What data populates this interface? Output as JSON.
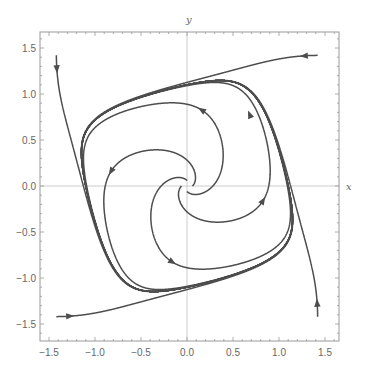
{
  "chart_data": {
    "type": "line",
    "subtype": "phase-portrait-stream",
    "title": "",
    "xlabel": "x",
    "ylabel": "y",
    "xlim": [
      -1.6,
      1.65
    ],
    "ylim": [
      -1.68,
      1.67
    ],
    "grid": false,
    "axes_through_origin": true,
    "legend": null,
    "x_ticks": [
      -1.5,
      -1.0,
      -0.5,
      0.0,
      0.5,
      1.0,
      1.5
    ],
    "x_tick_labels": [
      "−1.5",
      "−1.0",
      "−0.5",
      "0.0",
      "0.5",
      "1.0",
      "1.5"
    ],
    "y_ticks": [
      1.5,
      1.0,
      0.5,
      0.0,
      -0.5,
      -1.0,
      -1.5
    ],
    "y_tick_labels": [
      "1.5",
      "1.0",
      "0.5",
      "0.0",
      "−0.5",
      "−1.0",
      "−1.5"
    ],
    "system": {
      "dx": "x - y - x^3",
      "dy": "x + y - y^3",
      "description": "Trajectories spiral out from the unstable origin and in from the corners toward a stable limit cycle near the unit circle (counter-clockwise)."
    },
    "series": [
      {
        "name": "outer-top-right",
        "start": [
          1.42,
          1.42
        ],
        "t_end": 14,
        "arrow_at_t": 0.05
      },
      {
        "name": "outer-top-left",
        "start": [
          -1.42,
          1.42
        ],
        "t_end": 14,
        "arrow_at_t": 0.05
      },
      {
        "name": "outer-bottom-left",
        "start": [
          -1.42,
          -1.42
        ],
        "t_end": 14,
        "arrow_at_t": 0.05
      },
      {
        "name": "outer-bottom-right",
        "start": [
          1.42,
          -1.42
        ],
        "t_end": 14,
        "arrow_at_t": 0.05
      },
      {
        "name": "inner-right",
        "start": [
          0.06,
          0.0
        ],
        "t_end": 14,
        "arrow_at_t": 3.0
      },
      {
        "name": "inner-top",
        "start": [
          0.0,
          0.06
        ],
        "t_end": 14,
        "arrow_at_t": 3.0
      },
      {
        "name": "inner-left",
        "start": [
          -0.06,
          0.0
        ],
        "t_end": 14,
        "arrow_at_t": 3.0
      },
      {
        "name": "inner-bottom",
        "start": [
          0.0,
          -0.06
        ],
        "t_end": 14,
        "arrow_at_t": 3.0
      }
    ],
    "limit_cycle_arrow": {
      "at": [
        0.68,
        0.78
      ]
    },
    "colors": {
      "curve": "#4d4d4d",
      "frame": "#999999",
      "axis_line": "#cccccc",
      "text": "#666666"
    }
  }
}
